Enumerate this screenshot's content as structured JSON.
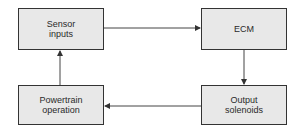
{
  "diagram": {
    "type": "flow-loop",
    "nodes": [
      {
        "id": "sensor",
        "label": "Sensor\ninputs"
      },
      {
        "id": "ecm",
        "label": "ECM"
      },
      {
        "id": "output",
        "label": "Output\nsolenoids"
      },
      {
        "id": "powertrain",
        "label": "Powertrain\noperation"
      }
    ],
    "edges": [
      {
        "from": "sensor",
        "to": "ecm"
      },
      {
        "from": "ecm",
        "to": "output"
      },
      {
        "from": "output",
        "to": "powertrain"
      },
      {
        "from": "powertrain",
        "to": "sensor"
      }
    ],
    "colors": {
      "box_fill": "#e8e8e8",
      "border": "#333333",
      "line": "#444444"
    }
  }
}
